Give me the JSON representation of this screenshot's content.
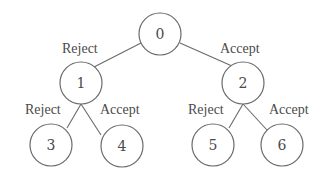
{
  "diagram": {
    "type": "binary-tree",
    "colors": {
      "stroke": "#6a6a6a",
      "text": "#4a4a4a",
      "background": "#ffffff"
    },
    "nodes": [
      {
        "id": "0",
        "label": "0",
        "cx": 160,
        "cy": 34,
        "r": 21
      },
      {
        "id": "1",
        "label": "1",
        "cx": 81,
        "cy": 83,
        "r": 21
      },
      {
        "id": "2",
        "label": "2",
        "cx": 243,
        "cy": 83,
        "r": 21
      },
      {
        "id": "3",
        "label": "3",
        "cx": 51,
        "cy": 145,
        "r": 21
      },
      {
        "id": "4",
        "label": "4",
        "cx": 122,
        "cy": 146,
        "r": 21
      },
      {
        "id": "5",
        "label": "5",
        "cx": 213,
        "cy": 145,
        "r": 21
      },
      {
        "id": "6",
        "label": "6",
        "cx": 282,
        "cy": 145,
        "r": 21
      }
    ],
    "edges": [
      {
        "from": "0",
        "to": "1",
        "label": "Reject",
        "x1": 141,
        "y1": 43,
        "x2": 94,
        "y2": 67,
        "lx": 62,
        "ly": 53
      },
      {
        "from": "0",
        "to": "2",
        "label": "Accept",
        "x1": 180,
        "y1": 43,
        "x2": 232,
        "y2": 66,
        "lx": 220,
        "ly": 53
      },
      {
        "from": "1",
        "to": "3",
        "label": "Reject",
        "x1": 81,
        "y1": 104,
        "x2": 67,
        "y2": 128,
        "lx": 25,
        "ly": 114
      },
      {
        "from": "1",
        "to": "4",
        "label": "Accept",
        "x1": 81,
        "y1": 104,
        "x2": 101,
        "y2": 135,
        "lx": 100,
        "ly": 114
      },
      {
        "from": "2",
        "to": "5",
        "label": "Reject",
        "x1": 243,
        "y1": 104,
        "x2": 229,
        "y2": 128,
        "lx": 188,
        "ly": 114
      },
      {
        "from": "2",
        "to": "6",
        "label": "Accept",
        "x1": 243,
        "y1": 104,
        "x2": 267,
        "y2": 130,
        "lx": 269,
        "ly": 114
      }
    ]
  }
}
